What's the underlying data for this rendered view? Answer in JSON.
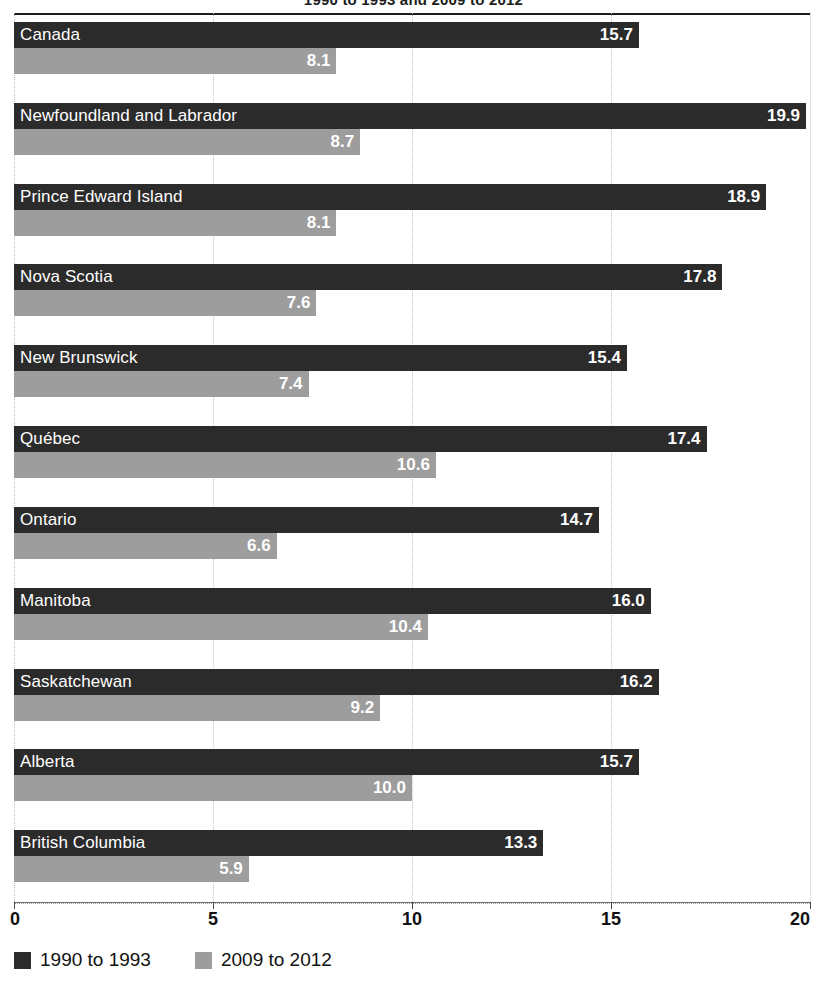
{
  "figure": {
    "clipped_title": "1990 to 1993 and 2009 to 2012"
  },
  "legend": {
    "position": "bottom-left",
    "items": [
      {
        "label": "1990 to 1993",
        "color": "#2b2b2b",
        "swatch": "legend-swatch-dark"
      },
      {
        "label": "2009 to 2012",
        "color": "#9d9d9d",
        "swatch": "legend-swatch-light"
      }
    ]
  },
  "axis": {
    "ticks": [
      "0",
      "5",
      "10",
      "15",
      "20"
    ],
    "tick_values": [
      0,
      5,
      10,
      15,
      20
    ]
  },
  "chart_data": {
    "type": "bar",
    "orientation": "horizontal",
    "title": "",
    "xlabel": "",
    "ylabel": "",
    "xlim": [
      0,
      20
    ],
    "grid": true,
    "legend_position": "bottom-left",
    "categories": [
      "Canada",
      "Newfoundland and Labrador",
      "Prince Edward Island",
      "Nova Scotia",
      "New Brunswick",
      "Québec",
      "Ontario",
      "Manitoba",
      "Saskatchewan",
      "Alberta",
      "British Columbia"
    ],
    "series": [
      {
        "name": "1990 to 1993",
        "color": "#2b2b2b",
        "values": [
          15.7,
          19.9,
          18.9,
          17.8,
          15.4,
          17.4,
          14.7,
          16.0,
          16.2,
          15.7,
          13.3
        ],
        "labels": [
          "15.7",
          "19.9",
          "18.9",
          "17.8",
          "15.4",
          "17.4",
          "14.7",
          "16.0",
          "16.2",
          "15.7",
          "13.3"
        ]
      },
      {
        "name": "2009 to 2012",
        "color": "#9d9d9d",
        "values": [
          8.1,
          8.7,
          8.1,
          7.6,
          7.4,
          10.6,
          6.6,
          10.4,
          9.2,
          10.0,
          5.9
        ],
        "labels": [
          "8.1",
          "8.7",
          "8.1",
          "7.6",
          "7.4",
          "10.6",
          "6.6",
          "10.4",
          "9.2",
          "10.0",
          "5.9"
        ]
      }
    ],
    "ticks": [
      0,
      5,
      10,
      15,
      20
    ]
  }
}
